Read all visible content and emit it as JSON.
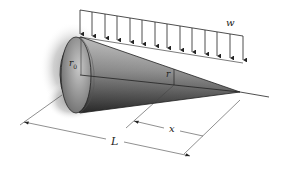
{
  "figure": {
    "labels": {
      "distributed_load": "w",
      "base_radius": "r",
      "base_radius_sub": "0",
      "radius_at_x": "r",
      "distance_x": "x",
      "length": "L"
    },
    "load": {
      "arrow_count": 14,
      "type": "uniform"
    },
    "colors": {
      "ink": "#222222",
      "cone_dark": "#3a3a3a",
      "cone_light": "#cfcfcf",
      "wall_shadow": "#9a9a9a",
      "background": "#ffffff"
    }
  }
}
